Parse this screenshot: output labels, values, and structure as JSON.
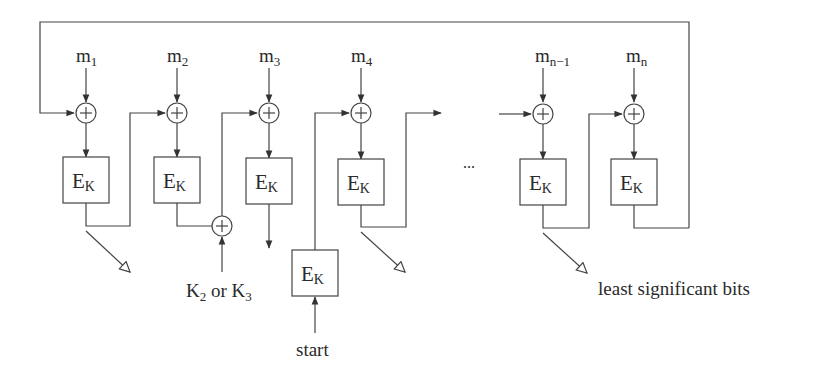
{
  "diagram": {
    "type": "block-cipher-mac-chain",
    "messages": [
      {
        "base": "m",
        "sub": "1"
      },
      {
        "base": "m",
        "sub": "2"
      },
      {
        "base": "m",
        "sub": "3"
      },
      {
        "base": "m",
        "sub": "4"
      },
      {
        "base": "m",
        "sub": "n−1"
      },
      {
        "base": "m",
        "sub": "n"
      }
    ],
    "cipher_block": {
      "base": "E",
      "sub": "K"
    },
    "key_label": {
      "k2": "K",
      "k2_sub": "2",
      "or": " or ",
      "k3": "K",
      "k3_sub": "3"
    },
    "start_label": "start",
    "ellipsis": "...",
    "output_label": "least significant bits",
    "xor_symbol": "+",
    "colors": {
      "stroke": "#444444",
      "text": "#2a2a2a",
      "background": "#ffffff"
    }
  }
}
